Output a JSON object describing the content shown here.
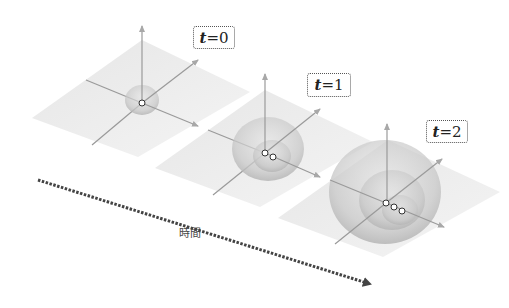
{
  "diagram": {
    "type": "time-evolution-of-expanding-spheres",
    "panels": [
      {
        "label_var": "t",
        "label_eq": " = ",
        "label_val": "0",
        "shell_count": 1,
        "point_count": 1
      },
      {
        "label_var": "t",
        "label_eq": " = ",
        "label_val": "1",
        "shell_count": 2,
        "point_count": 2
      },
      {
        "label_var": "t",
        "label_eq": " = ",
        "label_val": "2",
        "shell_count": 3,
        "point_count": 3
      }
    ],
    "time_arrow_label": "時間",
    "colors": {
      "plane": "#ececec",
      "axis": "#9a9a9a",
      "shell": "#c8c8c8",
      "arrow": "#444444",
      "label_border": "#555555"
    }
  }
}
